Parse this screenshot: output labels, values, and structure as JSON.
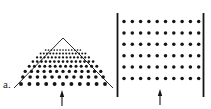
{
  "figure": {
    "width": 211,
    "height": 109,
    "background": "#ffffff",
    "ink_color": "#141414",
    "panel_label": "a."
  },
  "left_panel": {
    "name": "triangular-pile",
    "label": "a.",
    "apex": {
      "x": 63,
      "y": 38
    },
    "left_vertex": {
      "x": 14,
      "y": 88
    },
    "right_vertex": {
      "x": 113,
      "y": 88
    },
    "outline_stroke_width": 0.9,
    "rows": [
      {
        "index": 0,
        "count": 13,
        "y": 50.0,
        "spacing": 2.9,
        "radius": 0.85
      },
      {
        "index": 1,
        "count": 15,
        "y": 53.6,
        "spacing": 3.2,
        "radius": 1.0
      },
      {
        "index": 2,
        "count": 15,
        "y": 57.4,
        "spacing": 3.7,
        "radius": 1.15
      },
      {
        "index": 3,
        "count": 15,
        "y": 61.6,
        "spacing": 4.3,
        "radius": 1.3
      },
      {
        "index": 4,
        "count": 14,
        "y": 66.2,
        "spacing": 5.2,
        "radius": 1.5
      },
      {
        "index": 5,
        "count": 13,
        "y": 71.4,
        "spacing": 6.3,
        "radius": 1.65
      },
      {
        "index": 6,
        "count": 12,
        "y": 77.0,
        "spacing": 7.3,
        "radius": 1.8
      },
      {
        "index": 7,
        "count": 11,
        "y": 84.0,
        "spacing": 8.4,
        "radius": 1.95
      }
    ],
    "arrow": {
      "name": "force-arrow-left",
      "x": 62,
      "y_tail": 106,
      "y_head": 90,
      "head_width": 4.4,
      "head_length": 7.0,
      "shaft_width": 1.1
    }
  },
  "right_panel": {
    "name": "confined-lattice",
    "left_wall": {
      "x": 117.5,
      "y_top": 13,
      "y_bottom": 97,
      "width": 1.8
    },
    "right_wall": {
      "x": 203.5,
      "y_top": 13,
      "y_bottom": 97,
      "width": 1.8
    },
    "grid": {
      "rows": 6,
      "columns": 10,
      "x_start": 124.0,
      "x_spacing": 8.3,
      "y_start": 21.5,
      "y_spacing": 11.4,
      "dot_radius": 1.75
    },
    "arrow": {
      "name": "force-arrow-right",
      "x": 160,
      "y_tail": 105,
      "y_head": 89,
      "head_width": 4.4,
      "head_length": 7.0,
      "shaft_width": 1.1
    }
  }
}
